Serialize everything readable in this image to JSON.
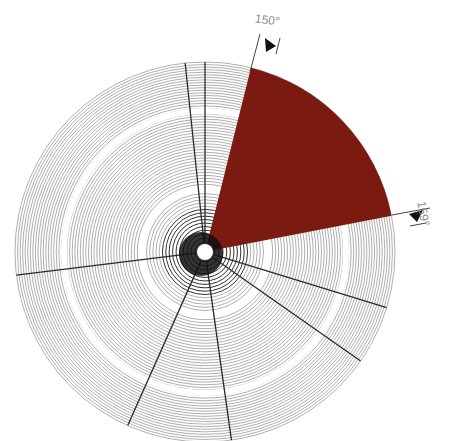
{
  "diagram": {
    "type": "concentric-disc-with-sector",
    "labels": {
      "angle_start": "150°",
      "angle_end": "159°"
    },
    "colors": {
      "sector": "#7a1a10",
      "rings": "#8c8c8c",
      "radials": "#2a2a2a",
      "background": "#ffffff"
    },
    "geometry": {
      "center": [
        205,
        252
      ],
      "outer_radius": 190,
      "ring_count": 64,
      "white_bands": [
        63,
        141
      ],
      "sector_angles_deg": [
        76,
        11
      ],
      "radial_angles_deg": [
        96,
        90,
        187,
        246,
        278,
        325,
        343
      ]
    }
  }
}
